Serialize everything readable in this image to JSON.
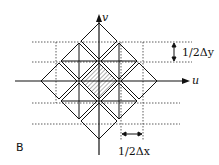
{
  "figure": {
    "panel_label": "B",
    "axes": {
      "horizontal": "u",
      "vertical": "v"
    },
    "annotations": {
      "dy": "1/2Δy",
      "dx": "1/2Δx"
    },
    "shaded_cell": "center diamond",
    "colors": {
      "line": "#111111",
      "dotted": "#333333",
      "hatch": "#777777"
    }
  }
}
